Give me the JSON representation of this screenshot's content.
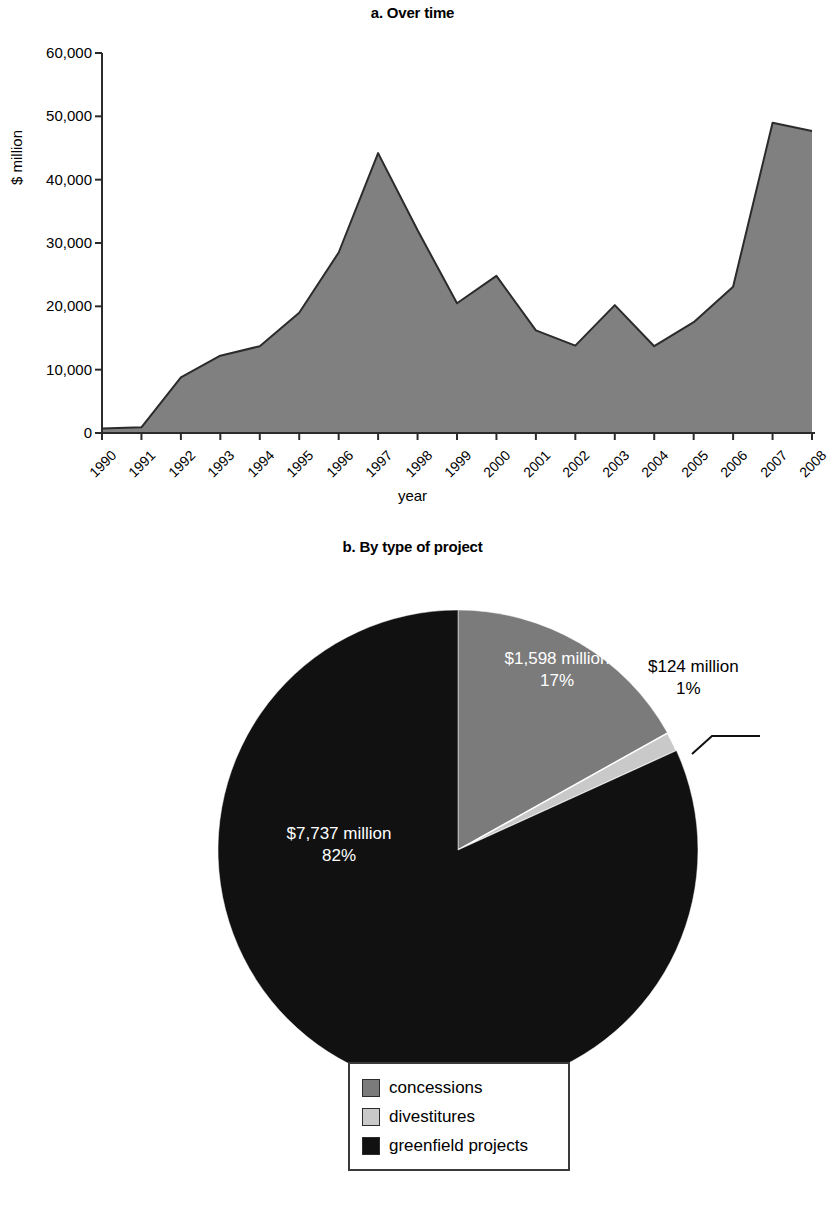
{
  "panel_a": {
    "title": "a. Over time",
    "ylabel": "$ million",
    "xlabel": "year"
  },
  "panel_b": {
    "title": "b. By type of project"
  },
  "pie_labels": {
    "concessions_value": "$1,598 million",
    "concessions_pct": "17%",
    "divestitures_value": "$124 million",
    "divestitures_pct": "1%",
    "greenfield_value": "$7,737 million",
    "greenfield_pct": "82%"
  },
  "legend": {
    "items": [
      {
        "label": "concessions",
        "color": "#7b7b7b"
      },
      {
        "label": "divestitures",
        "color": "#c9c9c9"
      },
      {
        "label": "greenfield projects",
        "color": "#111111"
      }
    ]
  },
  "colors": {
    "area_fill": "#808080",
    "area_stroke": "#2b2b2b",
    "axis": "#2b2b2b",
    "concessions": "#7b7b7b",
    "divestitures": "#c9c9c9",
    "greenfield": "#111111"
  },
  "chart_data": [
    {
      "type": "area",
      "title": "a. Over time",
      "xlabel": "year",
      "ylabel": "$ million",
      "xlim": [
        1990,
        2008
      ],
      "ylim": [
        0,
        60000
      ],
      "ytick_labels": [
        "0",
        "10,000",
        "20,000",
        "30,000",
        "40,000",
        "50,000",
        "60,000"
      ],
      "yticks": [
        0,
        10000,
        20000,
        30000,
        40000,
        50000,
        60000
      ],
      "grid": false,
      "legend": "none",
      "categories": [
        "1990",
        "1991",
        "1992",
        "1993",
        "1994",
        "1995",
        "1996",
        "1997",
        "1998",
        "1999",
        "2000",
        "2001",
        "2002",
        "2003",
        "2004",
        "2005",
        "2006",
        "2007",
        "2008"
      ],
      "values": [
        700,
        900,
        8800,
        12200,
        13700,
        19000,
        28500,
        44200,
        32000,
        20500,
        24800,
        16200,
        13800,
        20200,
        13700,
        17500,
        23100,
        49000,
        47700
      ]
    },
    {
      "type": "pie",
      "title": "b. By type of project",
      "labels": [
        "concessions",
        "divestitures",
        "greenfield projects"
      ],
      "values": [
        1598,
        124,
        7737
      ],
      "percents": [
        17,
        1,
        82
      ],
      "value_labels": [
        "$1,598 million",
        "$124 million",
        "$7,737 million"
      ],
      "percent_labels": [
        "17%",
        "1%",
        "82%"
      ],
      "colors": [
        "#7b7b7b",
        "#c9c9c9",
        "#111111"
      ],
      "start_angle": 0,
      "legend": "bottom"
    }
  ]
}
